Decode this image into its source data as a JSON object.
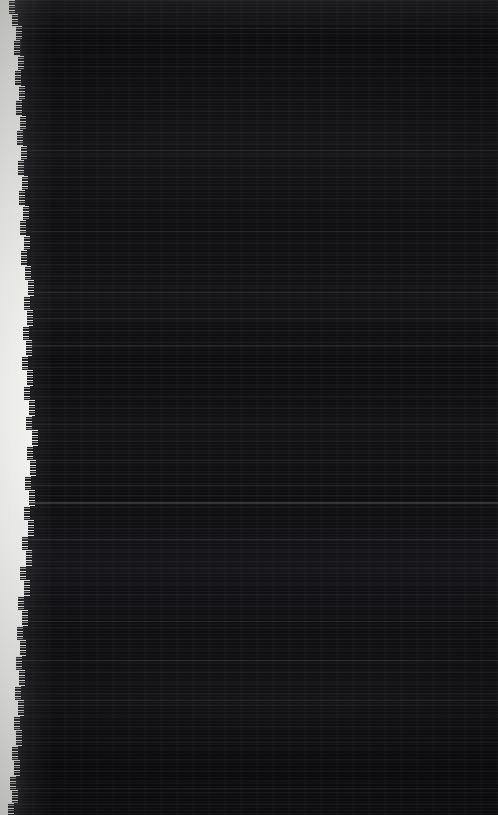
{
  "image": {
    "kind": "near-black-scan-artifact",
    "width_px": 498,
    "height_px": 815,
    "legible_text": "",
    "note_no_readable_content": "No text, icons, controls or chart elements are recoverable at any zoom level."
  },
  "colors": {
    "field_black": "#0b0b0d",
    "field_black_light": "#141418",
    "paper_white": "#f2f2f0",
    "streak_white": "#ffffff",
    "page_background": "#000000"
  },
  "regions": {
    "top_bar": {
      "x": 0,
      "y": 0,
      "width": 498,
      "height": 26
    },
    "dark_field": {
      "x": 0,
      "y": 0,
      "width": 498,
      "height": 815
    },
    "torn_margin_strip": {
      "edge": "left",
      "min_width_px": 7,
      "max_width_px": 32,
      "widest_at_y": 430
    }
  },
  "vertical_rule": {
    "x": 20,
    "y": 36,
    "width": 1,
    "height": 232
  },
  "bright_horizontal_streaks": [
    {
      "y": 28,
      "height": 1,
      "opacity": 0.1
    },
    {
      "y": 150,
      "height": 1,
      "opacity": 0.07
    },
    {
      "y": 231,
      "height": 1,
      "opacity": 0.06
    },
    {
      "y": 292,
      "height": 1,
      "opacity": 0.09
    },
    {
      "y": 318,
      "height": 1,
      "opacity": 0.07
    },
    {
      "y": 345,
      "height": 2,
      "opacity": 0.08
    },
    {
      "y": 367,
      "height": 1,
      "opacity": 0.06
    },
    {
      "y": 424,
      "height": 1,
      "opacity": 0.07
    },
    {
      "y": 460,
      "height": 1,
      "opacity": 0.06
    },
    {
      "y": 485,
      "height": 1,
      "opacity": 0.07
    },
    {
      "y": 502,
      "height": 2,
      "opacity": 0.16
    },
    {
      "y": 539,
      "height": 1,
      "opacity": 0.09
    },
    {
      "y": 568,
      "height": 1,
      "opacity": 0.06
    },
    {
      "y": 621,
      "height": 1,
      "opacity": 0.07
    },
    {
      "y": 660,
      "height": 1,
      "opacity": 0.06
    },
    {
      "y": 700,
      "height": 1,
      "opacity": 0.07
    },
    {
      "y": 742,
      "height": 1,
      "opacity": 0.06
    },
    {
      "y": 788,
      "height": 1,
      "opacity": 0.07
    }
  ],
  "margin_strip_profile": [
    {
      "y": 0,
      "height": 14,
      "width": 9
    },
    {
      "y": 14,
      "height": 12,
      "width": 12
    },
    {
      "y": 26,
      "height": 14,
      "width": 16
    },
    {
      "y": 40,
      "height": 16,
      "width": 14
    },
    {
      "y": 56,
      "height": 14,
      "width": 18
    },
    {
      "y": 70,
      "height": 16,
      "width": 15
    },
    {
      "y": 86,
      "height": 14,
      "width": 19
    },
    {
      "y": 100,
      "height": 16,
      "width": 16
    },
    {
      "y": 116,
      "height": 14,
      "width": 20
    },
    {
      "y": 130,
      "height": 16,
      "width": 17
    },
    {
      "y": 146,
      "height": 14,
      "width": 21
    },
    {
      "y": 160,
      "height": 16,
      "width": 18
    },
    {
      "y": 176,
      "height": 14,
      "width": 22
    },
    {
      "y": 190,
      "height": 16,
      "width": 19
    },
    {
      "y": 206,
      "height": 14,
      "width": 23
    },
    {
      "y": 220,
      "height": 16,
      "width": 20
    },
    {
      "y": 236,
      "height": 14,
      "width": 24
    },
    {
      "y": 250,
      "height": 16,
      "width": 21
    },
    {
      "y": 266,
      "height": 14,
      "width": 25
    },
    {
      "y": 280,
      "height": 16,
      "width": 28
    },
    {
      "y": 296,
      "height": 14,
      "width": 24
    },
    {
      "y": 310,
      "height": 16,
      "width": 27
    },
    {
      "y": 326,
      "height": 14,
      "width": 23
    },
    {
      "y": 340,
      "height": 16,
      "width": 26
    },
    {
      "y": 356,
      "height": 14,
      "width": 22
    },
    {
      "y": 370,
      "height": 16,
      "width": 27
    },
    {
      "y": 386,
      "height": 14,
      "width": 24
    },
    {
      "y": 400,
      "height": 16,
      "width": 29
    },
    {
      "y": 416,
      "height": 14,
      "width": 26
    },
    {
      "y": 430,
      "height": 16,
      "width": 32
    },
    {
      "y": 446,
      "height": 14,
      "width": 27
    },
    {
      "y": 460,
      "height": 16,
      "width": 30
    },
    {
      "y": 476,
      "height": 14,
      "width": 25
    },
    {
      "y": 490,
      "height": 16,
      "width": 29
    },
    {
      "y": 506,
      "height": 14,
      "width": 24
    },
    {
      "y": 520,
      "height": 16,
      "width": 28
    },
    {
      "y": 536,
      "height": 14,
      "width": 22
    },
    {
      "y": 550,
      "height": 16,
      "width": 26
    },
    {
      "y": 566,
      "height": 14,
      "width": 20
    },
    {
      "y": 580,
      "height": 16,
      "width": 24
    },
    {
      "y": 596,
      "height": 14,
      "width": 18
    },
    {
      "y": 610,
      "height": 16,
      "width": 22
    },
    {
      "y": 626,
      "height": 14,
      "width": 17
    },
    {
      "y": 640,
      "height": 16,
      "width": 20
    },
    {
      "y": 656,
      "height": 14,
      "width": 16
    },
    {
      "y": 670,
      "height": 16,
      "width": 19
    },
    {
      "y": 686,
      "height": 14,
      "width": 15
    },
    {
      "y": 700,
      "height": 16,
      "width": 18
    },
    {
      "y": 716,
      "height": 14,
      "width": 14
    },
    {
      "y": 730,
      "height": 16,
      "width": 16
    },
    {
      "y": 746,
      "height": 14,
      "width": 12
    },
    {
      "y": 760,
      "height": 16,
      "width": 14
    },
    {
      "y": 776,
      "height": 14,
      "width": 10
    },
    {
      "y": 790,
      "height": 13,
      "width": 12
    },
    {
      "y": 803,
      "height": 12,
      "width": 8
    }
  ]
}
